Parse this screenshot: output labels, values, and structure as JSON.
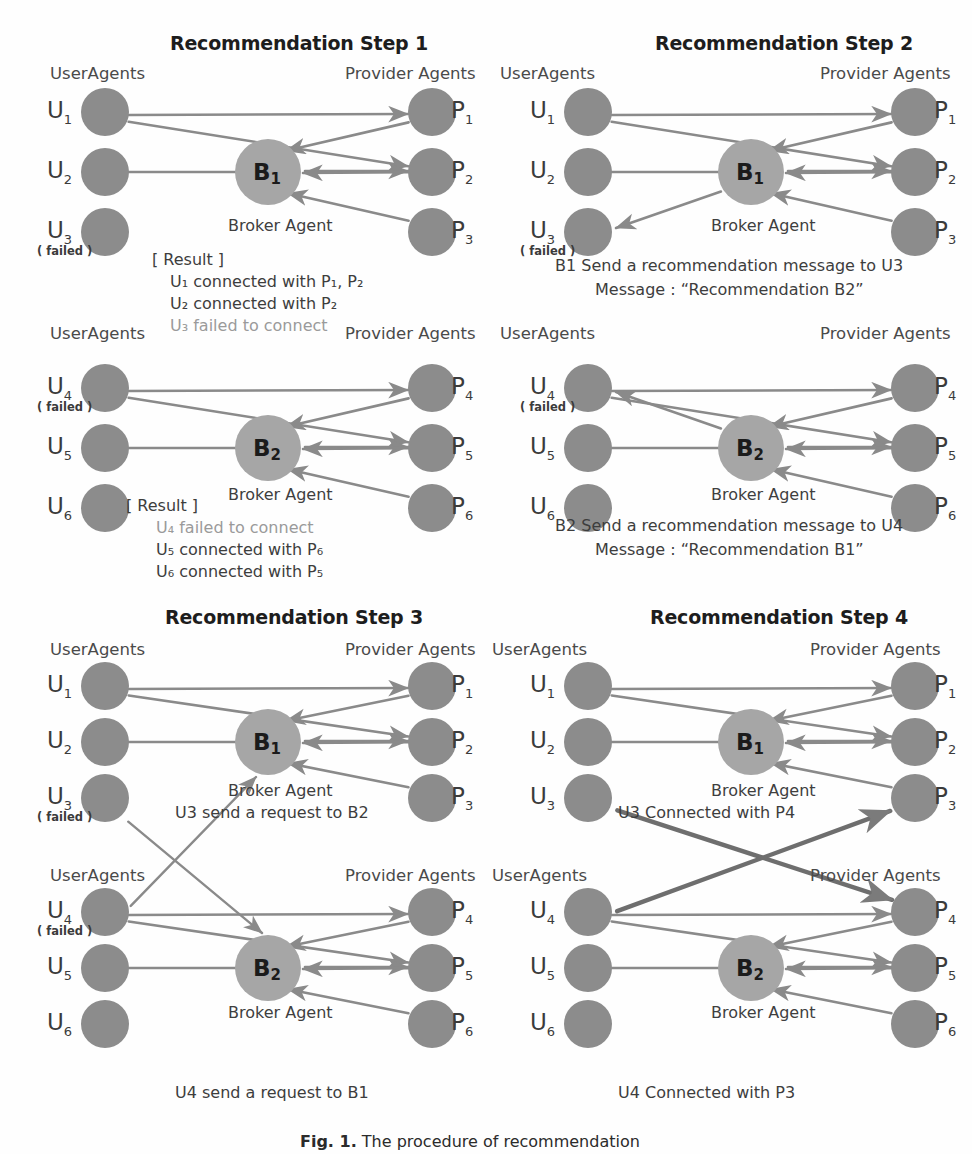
{
  "figure": {
    "caption_label": "Fig. 1.",
    "caption_text": "The procedure of recommendation"
  },
  "common": {
    "user_agents_heading": "UserAgents",
    "provider_agents_heading": "Provider Agents",
    "broker_agent_caption": "Broker Agent",
    "failed_tag": "( failed )",
    "result_header": "[ Result ]",
    "broker1": "B",
    "broker1_sub": "1",
    "broker2": "B",
    "broker2_sub": "2"
  },
  "colors": {
    "agent_node": "#8c8c8c",
    "broker_node": "#a6a6a6",
    "edge": "#8a8a8a",
    "edge_dark": "#6e6e6e",
    "text": "#3a3a3a",
    "dim_text": "#9a9a9a",
    "title": "#1d1d1d",
    "background": "#fefefe"
  },
  "panels": [
    {
      "id": "step1",
      "title": "Recommendation Step 1",
      "users": [
        {
          "label": "U",
          "sub": "1",
          "failed": false
        },
        {
          "label": "U",
          "sub": "2",
          "failed": false
        },
        {
          "label": "U",
          "sub": "3",
          "failed": true
        }
      ],
      "providers": [
        {
          "label": "P",
          "sub": "1"
        },
        {
          "label": "P",
          "sub": "2"
        },
        {
          "label": "P",
          "sub": "3"
        }
      ],
      "broker": {
        "label": "B",
        "sub": "1"
      },
      "caption_lines": [
        {
          "text": "[ Result ]",
          "dim": false
        },
        {
          "text": "U₁ connected with P₁, P₂",
          "dim": false
        },
        {
          "text": "U₂ connected with P₂",
          "dim": false
        },
        {
          "text": "U₃ failed to connect",
          "dim": true
        }
      ]
    },
    {
      "id": "step1b",
      "title": "",
      "users": [
        {
          "label": "U",
          "sub": "4",
          "failed": true
        },
        {
          "label": "U",
          "sub": "5",
          "failed": false
        },
        {
          "label": "U",
          "sub": "6",
          "failed": false
        }
      ],
      "providers": [
        {
          "label": "P",
          "sub": "4"
        },
        {
          "label": "P",
          "sub": "5"
        },
        {
          "label": "P",
          "sub": "6"
        }
      ],
      "broker": {
        "label": "B",
        "sub": "2"
      },
      "caption_lines": [
        {
          "text": "[ Result ]",
          "dim": false
        },
        {
          "text": "U₄ failed to connect",
          "dim": true
        },
        {
          "text": "U₅ connected with P₆",
          "dim": false
        },
        {
          "text": "U₆ connected with P₅",
          "dim": false
        }
      ]
    },
    {
      "id": "step2",
      "title": "Recommendation Step 2",
      "users": [
        {
          "label": "U",
          "sub": "1",
          "failed": false
        },
        {
          "label": "U",
          "sub": "2",
          "failed": false
        },
        {
          "label": "U",
          "sub": "3",
          "failed": true
        }
      ],
      "providers": [
        {
          "label": "P",
          "sub": "1"
        },
        {
          "label": "P",
          "sub": "2"
        },
        {
          "label": "P",
          "sub": "3"
        }
      ],
      "broker": {
        "label": "B",
        "sub": "1"
      },
      "caption_lines": [
        {
          "text": "B1 Send a recommendation message to U3",
          "dim": false
        },
        {
          "text": "Message : “Recommendation B2”",
          "dim": false
        }
      ]
    },
    {
      "id": "step2b",
      "title": "",
      "users": [
        {
          "label": "U",
          "sub": "4",
          "failed": true
        },
        {
          "label": "U",
          "sub": "5",
          "failed": false
        },
        {
          "label": "U",
          "sub": "6",
          "failed": false
        }
      ],
      "providers": [
        {
          "label": "P",
          "sub": "4"
        },
        {
          "label": "P",
          "sub": "5"
        },
        {
          "label": "P",
          "sub": "6"
        }
      ],
      "broker": {
        "label": "B",
        "sub": "2"
      },
      "caption_lines": [
        {
          "text": "B2 Send a recommendation message to U4",
          "dim": false
        },
        {
          "text": "Message : “Recommendation B1”",
          "dim": false
        }
      ]
    },
    {
      "id": "step3",
      "title": "Recommendation Step 3",
      "users": [
        {
          "label": "U",
          "sub": "1",
          "failed": false
        },
        {
          "label": "U",
          "sub": "2",
          "failed": false
        },
        {
          "label": "U",
          "sub": "3",
          "failed": true
        }
      ],
      "providers": [
        {
          "label": "P",
          "sub": "1"
        },
        {
          "label": "P",
          "sub": "2"
        },
        {
          "label": "P",
          "sub": "3"
        }
      ],
      "broker": {
        "label": "B",
        "sub": "1"
      },
      "caption_lines": [
        {
          "text": "U3 send a request to B2",
          "dim": false
        }
      ]
    },
    {
      "id": "step3b",
      "title": "",
      "users": [
        {
          "label": "U",
          "sub": "4",
          "failed": true
        },
        {
          "label": "U",
          "sub": "5",
          "failed": false
        },
        {
          "label": "U",
          "sub": "6",
          "failed": false
        }
      ],
      "providers": [
        {
          "label": "P",
          "sub": "4"
        },
        {
          "label": "P",
          "sub": "5"
        },
        {
          "label": "P",
          "sub": "6"
        }
      ],
      "broker": {
        "label": "B",
        "sub": "2"
      },
      "caption_lines": [
        {
          "text": "U4 send a request to B1",
          "dim": false
        }
      ]
    },
    {
      "id": "step4",
      "title": "Recommendation Step 4",
      "users": [
        {
          "label": "U",
          "sub": "1",
          "failed": false
        },
        {
          "label": "U",
          "sub": "2",
          "failed": false
        },
        {
          "label": "U",
          "sub": "3",
          "failed": false
        }
      ],
      "providers": [
        {
          "label": "P",
          "sub": "1"
        },
        {
          "label": "P",
          "sub": "2"
        },
        {
          "label": "P",
          "sub": "3"
        }
      ],
      "broker": {
        "label": "B",
        "sub": "1"
      },
      "caption_lines": [
        {
          "text": "U3 Connected with P4",
          "dim": false
        }
      ]
    },
    {
      "id": "step4b",
      "title": "",
      "users": [
        {
          "label": "U",
          "sub": "4",
          "failed": false
        },
        {
          "label": "U",
          "sub": "5",
          "failed": false
        },
        {
          "label": "U",
          "sub": "6",
          "failed": false
        }
      ],
      "providers": [
        {
          "label": "P",
          "sub": "4"
        },
        {
          "label": "P",
          "sub": "5"
        },
        {
          "label": "P",
          "sub": "6"
        }
      ],
      "broker": {
        "label": "B",
        "sub": "2"
      },
      "caption_lines": [
        {
          "text": "U4 Connected with P3",
          "dim": false
        }
      ]
    }
  ]
}
